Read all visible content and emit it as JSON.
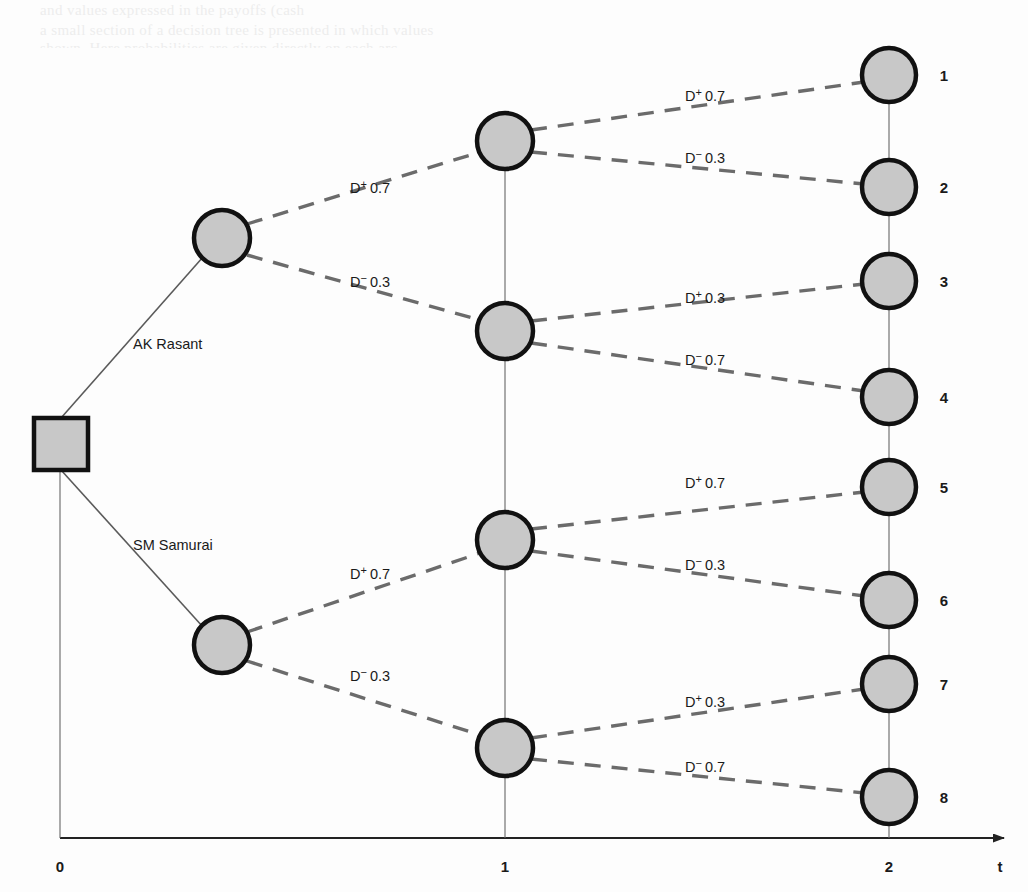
{
  "diagram": {
    "background_color": "#fdfdfd",
    "node_fill_color": "#c8c8c8",
    "node_stroke_color": "#111111",
    "branch_line_color": "#5a5a5a",
    "axis_color": "#222222"
  },
  "root": {
    "node_name": "decision-node",
    "shape": "square"
  },
  "decisions": [
    {
      "label": "AK Rasant",
      "x": 133,
      "y": 344
    },
    {
      "label": "SM Samurai",
      "x": 133,
      "y": 545
    }
  ],
  "stage1_labels": [
    {
      "label_d": "D",
      "sign": "+",
      "prob": "0.7",
      "x": 350,
      "y": 193
    },
    {
      "label_d": "D",
      "sign": "−",
      "prob": "0.3",
      "x": 350,
      "y": 287
    },
    {
      "label_d": "D",
      "sign": "+",
      "prob": "0.7",
      "x": 350,
      "y": 579
    },
    {
      "label_d": "D",
      "sign": "−",
      "prob": "0.3",
      "x": 350,
      "y": 681
    }
  ],
  "stage2_labels": [
    {
      "label_d": "D",
      "sign": "+",
      "prob": "0.7",
      "x": 685,
      "y": 101
    },
    {
      "label_d": "D",
      "sign": "−",
      "prob": "0.3",
      "x": 685,
      "y": 163
    },
    {
      "label_d": "D",
      "sign": "+",
      "prob": "0.3",
      "x": 685,
      "y": 303
    },
    {
      "label_d": "D",
      "sign": "−",
      "prob": "0.7",
      "x": 685,
      "y": 365
    },
    {
      "label_d": "D",
      "sign": "+",
      "prob": "0.7",
      "x": 685,
      "y": 488
    },
    {
      "label_d": "D",
      "sign": "−",
      "prob": "0.3",
      "x": 685,
      "y": 570
    },
    {
      "label_d": "D",
      "sign": "+",
      "prob": "0.3",
      "x": 685,
      "y": 707
    },
    {
      "label_d": "D",
      "sign": "−",
      "prob": "0.7",
      "x": 685,
      "y": 772
    }
  ],
  "chance_nodes_stage1": [
    {
      "name": "chance-node-upper",
      "cx": 222,
      "cy": 238,
      "r": 28
    },
    {
      "name": "chance-node-lower",
      "cx": 222,
      "cy": 645,
      "r": 28
    }
  ],
  "chance_nodes_stage2": [
    {
      "name": "chance-node-t1-1",
      "cx": 505,
      "cy": 141,
      "r": 28
    },
    {
      "name": "chance-node-t1-2",
      "cx": 505,
      "cy": 331,
      "r": 28
    },
    {
      "name": "chance-node-t1-3",
      "cx": 505,
      "cy": 540,
      "r": 28
    },
    {
      "name": "chance-node-t1-4",
      "cx": 505,
      "cy": 748,
      "r": 28
    }
  ],
  "leaves": [
    {
      "label": "1",
      "cx": 889,
      "cy": 75,
      "r": 27
    },
    {
      "label": "2",
      "cx": 889,
      "cy": 187,
      "r": 27
    },
    {
      "label": "3",
      "cx": 889,
      "cy": 281,
      "r": 27
    },
    {
      "label": "4",
      "cx": 889,
      "cy": 397,
      "r": 27
    },
    {
      "label": "5",
      "cx": 889,
      "cy": 487,
      "r": 27
    },
    {
      "label": "6",
      "cx": 889,
      "cy": 600,
      "r": 27
    },
    {
      "label": "7",
      "cx": 889,
      "cy": 684,
      "r": 27
    },
    {
      "label": "8",
      "cx": 889,
      "cy": 797,
      "r": 27
    }
  ],
  "axis": {
    "name": "time-axis",
    "label": "t",
    "label_x": 1000,
    "label_y": 872,
    "y": 838,
    "x_start": 60,
    "x_end": 1010,
    "ticks": [
      {
        "label": "0",
        "x": 60
      },
      {
        "label": "1",
        "x": 505
      },
      {
        "label": "2",
        "x": 889
      }
    ],
    "tick_label_y": 872
  },
  "scan_artifacts": {
    "lines": [
      {
        "text": "and values  expressed  in  the payoffs  (cash",
        "x": 60,
        "y": 2
      },
      {
        "text": "a small  section  of  a  decision  tree is presented  in  which  values",
        "x": 60,
        "y": 22
      },
      {
        "text": "shown.  Here  probabilities  are  given  directly  on  each  arc.",
        "x": 60,
        "y": 40
      }
    ]
  }
}
